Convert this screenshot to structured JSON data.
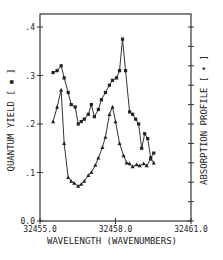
{
  "chart_data": {
    "type": "line",
    "title": "",
    "xlabel": "WAVELENGTH (WAVENUMBERS)",
    "ylabel": "QUANTUM YIELD [ ▪ ]",
    "ylabel_right": "ABSORPTION PROFILE [ • ]",
    "xlim": [
      32455.0,
      32461.0
    ],
    "ylim": [
      0.0,
      0.42
    ],
    "x_ticks": [
      32455.0,
      32458.0,
      32461.0
    ],
    "x_tick_labels": [
      "32455.0",
      "32458.0",
      "32461.0"
    ],
    "y_ticks": [
      0.0,
      0.1,
      0.2,
      0.3,
      0.4
    ],
    "y_tick_labels": [
      "0.0",
      ".1",
      ".2",
      ".3",
      ".4"
    ],
    "right_axis_ticks": 11,
    "grid": false,
    "legend": "none",
    "series": [
      {
        "name": "Quantum yield",
        "marker": "square",
        "x": [
          32455.52,
          32455.68,
          32455.84,
          32455.96,
          32456.12,
          32456.24,
          32456.4,
          32456.52,
          32456.64,
          32456.76,
          32456.92,
          32457.04,
          32457.16,
          32457.32,
          32457.44,
          32457.6,
          32457.76,
          32457.88,
          32458.04,
          32458.16,
          32458.28,
          32458.4,
          32458.56,
          32458.68,
          32458.8,
          32458.92,
          32459.04,
          32459.16,
          32459.28,
          32459.4,
          32459.52
        ],
        "values": [
          0.306,
          0.31,
          0.32,
          0.295,
          0.265,
          0.24,
          0.235,
          0.2,
          0.205,
          0.21,
          0.22,
          0.24,
          0.215,
          0.23,
          0.25,
          0.265,
          0.28,
          0.29,
          0.295,
          0.31,
          0.375,
          0.31,
          0.225,
          0.22,
          0.21,
          0.2,
          0.15,
          0.18,
          0.17,
          0.13,
          0.14
        ]
      },
      {
        "name": "Absorption profile",
        "marker": "triangle",
        "x": [
          32455.52,
          32455.68,
          32455.84,
          32455.96,
          32456.12,
          32456.24,
          32456.36,
          32456.52,
          32456.64,
          32456.76,
          32456.92,
          32457.04,
          32457.2,
          32457.32,
          32457.48,
          32457.6,
          32457.76,
          32457.88,
          32458.0,
          32458.16,
          32458.32,
          32458.44,
          32458.56,
          32458.68,
          32458.84,
          32458.96,
          32459.12,
          32459.24,
          32459.4,
          32459.52
        ],
        "values": [
          0.205,
          0.235,
          0.27,
          0.16,
          0.09,
          0.082,
          0.078,
          0.072,
          0.076,
          0.082,
          0.094,
          0.1,
          0.115,
          0.13,
          0.152,
          0.173,
          0.22,
          0.235,
          0.205,
          0.16,
          0.135,
          0.12,
          0.118,
          0.112,
          0.116,
          0.114,
          0.118,
          0.114,
          0.128,
          0.12
        ]
      }
    ]
  }
}
